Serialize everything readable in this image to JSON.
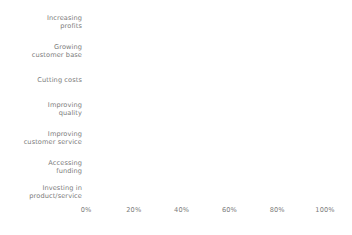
{
  "chart_data": {
    "type": "bar",
    "orientation": "horizontal",
    "title": "",
    "subtitle": "",
    "xlabel": "",
    "ylabel": "",
    "xlim": [
      0,
      100
    ],
    "grid": false,
    "legend": "none",
    "xtick_labels": [
      "0%",
      "20%",
      "40%",
      "60%",
      "80%",
      "100%"
    ],
    "xtick_values": [
      0,
      20,
      40,
      60,
      80,
      100
    ],
    "categories": [
      "Increasing\nprofits",
      "Growing\ncustomer base",
      "Cutting costs",
      "Improving\nquality",
      "Improving\ncustomer service",
      "Accessing\nfunding",
      "Investing in\nproduct/service"
    ],
    "values": [
      86,
      77,
      77,
      77,
      96,
      33,
      68
    ],
    "bar_colors": [
      "#d3d3d3",
      "#9a9a9a",
      "#d3d3d3",
      "#9a9a9a",
      "#6e6e6e",
      "#d6d6d6",
      "#6e6e6e"
    ]
  },
  "style": {
    "background": "#ffffff",
    "text_color": "#7b7b7b"
  }
}
